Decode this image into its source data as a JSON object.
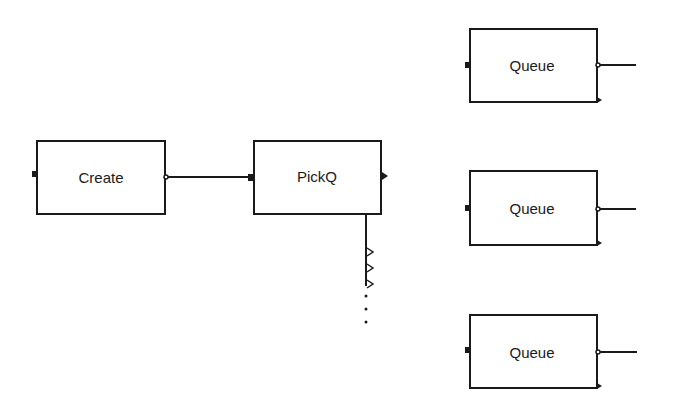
{
  "diagram": {
    "blocks": [
      {
        "id": "create",
        "label": "Create"
      },
      {
        "id": "pickq",
        "label": "PickQ"
      },
      {
        "id": "queue1",
        "label": "Queue"
      },
      {
        "id": "queue2",
        "label": "Queue"
      },
      {
        "id": "queue3",
        "label": "Queue"
      }
    ],
    "connections": [
      {
        "from": "create",
        "to": "pickq"
      }
    ],
    "pickq_outputs": {
      "shown_ports": 3,
      "continuation": "..."
    },
    "colors": {
      "stroke": "#1a1a1a",
      "background": "#ffffff"
    }
  }
}
